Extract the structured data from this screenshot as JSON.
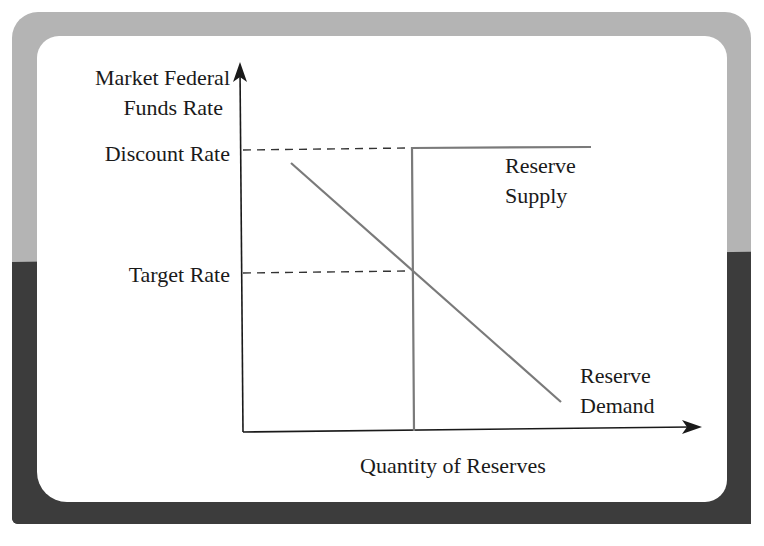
{
  "diagram": {
    "y_axis_label_line1": "Market Federal",
    "y_axis_label_line2": "Funds Rate",
    "x_axis_label": "Quantity of Reserves",
    "discount_rate_label": "Discount Rate",
    "target_rate_label": "Target Rate",
    "supply_label_line1": "Reserve",
    "supply_label_line2": "Supply",
    "demand_label_line1": "Reserve",
    "demand_label_line2": "Demand"
  },
  "colors": {
    "frame_top": "#b4b4b4",
    "frame_bottom": "#3c3c3c",
    "panel": "#ffffff",
    "axis": "#1a1a1a",
    "curve": "#7a7a7a"
  }
}
